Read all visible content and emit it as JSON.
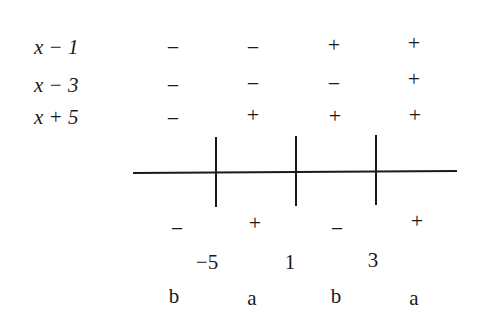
{
  "diagram": {
    "type": "sign-chart",
    "factors": [
      {
        "label": "x − 1",
        "signs": [
          "−",
          "−",
          "+",
          "+"
        ]
      },
      {
        "label": "x − 3",
        "signs": [
          "−",
          "−",
          "−",
          "+"
        ]
      },
      {
        "label": "x + 5",
        "signs": [
          "−",
          "+",
          "+",
          "+"
        ]
      }
    ],
    "product_signs": [
      "−",
      "+",
      "−",
      "+"
    ],
    "critical_points": [
      "−5",
      "1",
      "3"
    ],
    "interval_labels": [
      "b",
      "a",
      "b",
      "a"
    ]
  }
}
